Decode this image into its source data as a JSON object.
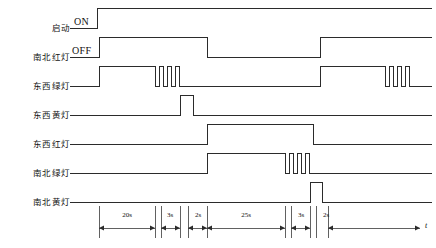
{
  "signals": [
    {
      "label": "启动",
      "name": "start"
    },
    {
      "label": "南北红灯",
      "name": "ns-red"
    },
    {
      "label": "东西绿灯",
      "name": "ew-green"
    },
    {
      "label": "东西黄灯",
      "name": "ew-yellow"
    },
    {
      "label": "东西红灯",
      "name": "ew-red"
    },
    {
      "label": "南北绿灯",
      "name": "ns-green"
    },
    {
      "label": "南北黄灯",
      "name": "ns-yellow"
    }
  ],
  "state_labels": {
    "on": "ON",
    "off": "OFF"
  },
  "time_axis": {
    "variable": "t",
    "segments": [
      {
        "label": "20s"
      },
      {
        "label": "3s"
      },
      {
        "label": "2s"
      },
      {
        "label": "25s"
      },
      {
        "label": "3s"
      },
      {
        "label": "2s"
      }
    ]
  },
  "colors": {
    "waveform": "#2b2b2b",
    "axis": "#3a3a3a",
    "text": "#111111",
    "background": "#ffffff"
  },
  "chart_data": {
    "type": "line",
    "xlabel": "t",
    "ylabel": "",
    "grid": false,
    "legend": "none",
    "xlim": [
      0,
      436
    ],
    "series": [
      {
        "name": "启动",
        "state_label": "ON",
        "values": [
          {
            "x": 70,
            "level": 0
          },
          {
            "x": 97,
            "level": 0
          },
          {
            "x": 97,
            "level": 1
          },
          {
            "x": 432,
            "level": 1
          }
        ]
      },
      {
        "name": "南北红灯",
        "state_label": "OFF",
        "values": [
          {
            "x": 70,
            "level": 0
          },
          {
            "x": 99,
            "level": 0
          },
          {
            "x": 99,
            "level": 1
          },
          {
            "x": 207,
            "level": 1
          },
          {
            "x": 207,
            "level": 0
          },
          {
            "x": 320,
            "level": 0
          },
          {
            "x": 320,
            "level": 1
          },
          {
            "x": 432,
            "level": 1
          }
        ]
      },
      {
        "name": "东西绿灯",
        "state_label": "",
        "values": [
          {
            "x": 70,
            "level": 0
          },
          {
            "x": 99,
            "level": 0
          },
          {
            "x": 99,
            "level": 1
          },
          {
            "x": 155,
            "level": 1
          },
          {
            "x": 155,
            "level": 0
          },
          {
            "x": 159,
            "level": 0
          },
          {
            "x": 159,
            "level": 1
          },
          {
            "x": 163,
            "level": 1
          },
          {
            "x": 163,
            "level": 0
          },
          {
            "x": 167,
            "level": 0
          },
          {
            "x": 167,
            "level": 1
          },
          {
            "x": 171,
            "level": 1
          },
          {
            "x": 171,
            "level": 0
          },
          {
            "x": 175,
            "level": 0
          },
          {
            "x": 175,
            "level": 1
          },
          {
            "x": 179,
            "level": 1
          },
          {
            "x": 179,
            "level": 0
          },
          {
            "x": 320,
            "level": 0
          },
          {
            "x": 320,
            "level": 1
          },
          {
            "x": 385,
            "level": 1
          },
          {
            "x": 385,
            "level": 0
          },
          {
            "x": 389,
            "level": 0
          },
          {
            "x": 389,
            "level": 1
          },
          {
            "x": 393,
            "level": 1
          },
          {
            "x": 393,
            "level": 0
          },
          {
            "x": 397,
            "level": 0
          },
          {
            "x": 397,
            "level": 1
          },
          {
            "x": 401,
            "level": 1
          },
          {
            "x": 401,
            "level": 0
          },
          {
            "x": 405,
            "level": 0
          },
          {
            "x": 405,
            "level": 1
          },
          {
            "x": 409,
            "level": 1
          },
          {
            "x": 409,
            "level": 0
          },
          {
            "x": 432,
            "level": 0
          }
        ]
      },
      {
        "name": "东西黄灯",
        "state_label": "",
        "values": [
          {
            "x": 70,
            "level": 0
          },
          {
            "x": 180,
            "level": 0
          },
          {
            "x": 180,
            "level": 1
          },
          {
            "x": 193,
            "level": 1
          },
          {
            "x": 193,
            "level": 0
          },
          {
            "x": 432,
            "level": 0
          }
        ]
      },
      {
        "name": "东西红灯",
        "state_label": "",
        "values": [
          {
            "x": 70,
            "level": 0
          },
          {
            "x": 207,
            "level": 0
          },
          {
            "x": 207,
            "level": 1
          },
          {
            "x": 313,
            "level": 1
          },
          {
            "x": 313,
            "level": 0
          },
          {
            "x": 432,
            "level": 0
          }
        ]
      },
      {
        "name": "南北绿灯",
        "state_label": "",
        "values": [
          {
            "x": 70,
            "level": 0
          },
          {
            "x": 207,
            "level": 0
          },
          {
            "x": 207,
            "level": 1
          },
          {
            "x": 285,
            "level": 1
          },
          {
            "x": 285,
            "level": 0
          },
          {
            "x": 289,
            "level": 0
          },
          {
            "x": 289,
            "level": 1
          },
          {
            "x": 293,
            "level": 1
          },
          {
            "x": 293,
            "level": 0
          },
          {
            "x": 297,
            "level": 0
          },
          {
            "x": 297,
            "level": 1
          },
          {
            "x": 301,
            "level": 1
          },
          {
            "x": 301,
            "level": 0
          },
          {
            "x": 305,
            "level": 0
          },
          {
            "x": 305,
            "level": 1
          },
          {
            "x": 309,
            "level": 1
          },
          {
            "x": 309,
            "level": 0
          },
          {
            "x": 432,
            "level": 0
          }
        ]
      },
      {
        "name": "南北黄灯",
        "state_label": "",
        "values": [
          {
            "x": 70,
            "level": 0
          },
          {
            "x": 310,
            "level": 0
          },
          {
            "x": 310,
            "level": 1
          },
          {
            "x": 322,
            "level": 1
          },
          {
            "x": 322,
            "level": 0
          },
          {
            "x": 432,
            "level": 0
          }
        ]
      }
    ],
    "annotations": [
      {
        "text": "20s",
        "x_start": 99,
        "x_end": 155
      },
      {
        "text": "3s",
        "x_start": 161,
        "x_end": 180
      },
      {
        "text": "2s",
        "x_start": 188,
        "x_end": 207
      },
      {
        "text": "25s",
        "x_start": 207,
        "x_end": 285
      },
      {
        "text": "3s",
        "x_start": 291,
        "x_end": 310
      },
      {
        "text": "2s",
        "x_start": 316,
        "x_end": 328
      }
    ]
  }
}
